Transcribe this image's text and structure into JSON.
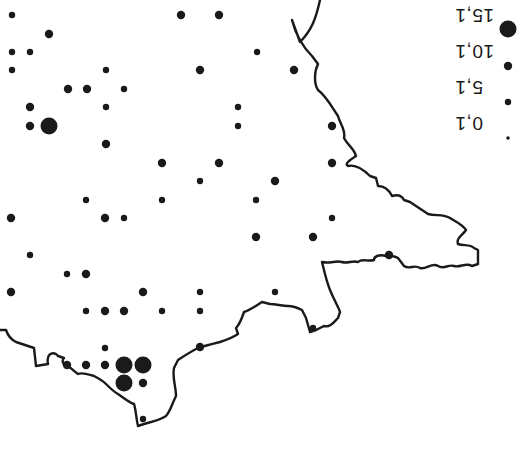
{
  "map": {
    "orientation": "rotated 180 degrees",
    "ink_color": "#1a1a1a",
    "background_color": "#ffffff",
    "coastline": "M320,0 C316,18 312,30 300,42 L292,20 C296,36 304,48 312,56 L318,64 C314,72 314,84 318,90 C326,96 330,104 338,116 C340,124 346,130 344,138 C348,146 354,148 356,156 C350,160 344,164 348,166 C356,164 364,170 370,176 L376,178 L378,186 C386,186 390,192 392,196 C398,194 402,196 404,200 L410,202 C416,206 422,210 428,214 C436,216 444,214 450,218 C456,222 462,224 466,230 C462,236 456,238 458,244 C464,246 470,244 474,248 L478,250 L478,264 L472,266 C466,262 460,268 454,266 C448,264 444,270 438,266 C432,262 426,270 420,268 C414,264 410,270 404,266 L398,258 C392,254 390,258 386,256 C380,254 374,256 374,260 C368,262 362,258 358,262 C352,260 348,264 342,262 C336,260 330,264 322,262 C324,270 326,280 330,290 C334,300 338,306 340,312 L338,318 C334,322 330,328 324,326 L316,330 L310,332 L306,318 L302,310 C298,308 294,306 288,306 C282,306 276,304 270,304 L262,302 C256,306 250,310 244,312 C242,318 240,324 236,328 L238,334 C232,338 226,340 220,342 C212,344 204,346 198,348 C190,352 184,356 178,360 L174,368 C172,378 176,386 176,396 C172,404 170,412 166,416 C160,420 152,422 144,424 L138,426 C136,418 136,410 134,404 C128,402 124,398 118,394 C114,392 110,388 106,384 C102,380 98,378 94,376 C88,374 82,372 78,374 C72,370 70,366 66,366 C62,364 62,360 64,358 L58,356 L56,354 C52,352 46,354 48,364 L36,366 L34,348 C28,346 22,344 16,342 C12,340 8,336 6,330 L0,330",
    "points": [
      {
        "x": 12,
        "y": 15,
        "value": 5.1
      },
      {
        "x": 49,
        "y": 34,
        "value": 10.1
      },
      {
        "x": 12,
        "y": 52,
        "value": 5.1
      },
      {
        "x": 30,
        "y": 52,
        "value": 5.1
      },
      {
        "x": 12,
        "y": 70,
        "value": 5.1
      },
      {
        "x": 106,
        "y": 70,
        "value": 5.1
      },
      {
        "x": 68,
        "y": 89,
        "value": 10.1
      },
      {
        "x": 87,
        "y": 89,
        "value": 10.1
      },
      {
        "x": 124,
        "y": 89,
        "value": 5.1
      },
      {
        "x": 30,
        "y": 107,
        "value": 10.1
      },
      {
        "x": 106,
        "y": 107,
        "value": 5.1
      },
      {
        "x": 30,
        "y": 126,
        "value": 10.1
      },
      {
        "x": 49,
        "y": 126,
        "value": 15.1
      },
      {
        "x": 106,
        "y": 144,
        "value": 10.1
      },
      {
        "x": 181,
        "y": 15,
        "value": 10.1
      },
      {
        "x": 219,
        "y": 15,
        "value": 10.1
      },
      {
        "x": 257,
        "y": 52,
        "value": 5.1
      },
      {
        "x": 200,
        "y": 70,
        "value": 10.1
      },
      {
        "x": 294,
        "y": 70,
        "value": 10.1
      },
      {
        "x": 238,
        "y": 107,
        "value": 5.1
      },
      {
        "x": 238,
        "y": 126,
        "value": 5.1
      },
      {
        "x": 332,
        "y": 126,
        "value": 10.1
      },
      {
        "x": 332,
        "y": 163,
        "value": 10.1
      },
      {
        "x": 332,
        "y": 218,
        "value": 5.1
      },
      {
        "x": 313,
        "y": 237,
        "value": 10.1
      },
      {
        "x": 389,
        "y": 255,
        "value": 10.1
      },
      {
        "x": 162,
        "y": 163,
        "value": 10.1
      },
      {
        "x": 219,
        "y": 163,
        "value": 10.1
      },
      {
        "x": 200,
        "y": 181,
        "value": 5.1
      },
      {
        "x": 275,
        "y": 181,
        "value": 10.1
      },
      {
        "x": 86,
        "y": 200,
        "value": 5.1
      },
      {
        "x": 162,
        "y": 200,
        "value": 5.1
      },
      {
        "x": 256,
        "y": 200,
        "value": 5.1
      },
      {
        "x": 11,
        "y": 218,
        "value": 10.1
      },
      {
        "x": 105,
        "y": 218,
        "value": 10.1
      },
      {
        "x": 124,
        "y": 218,
        "value": 5.1
      },
      {
        "x": 256,
        "y": 237,
        "value": 10.1
      },
      {
        "x": 30,
        "y": 255,
        "value": 5.1
      },
      {
        "x": 67,
        "y": 274,
        "value": 5.1
      },
      {
        "x": 86,
        "y": 274,
        "value": 10.1
      },
      {
        "x": 200,
        "y": 292,
        "value": 5.1
      },
      {
        "x": 275,
        "y": 292,
        "value": 5.1
      },
      {
        "x": 11,
        "y": 292,
        "value": 10.1
      },
      {
        "x": 143,
        "y": 292,
        "value": 10.1
      },
      {
        "x": 86,
        "y": 311,
        "value": 5.1
      },
      {
        "x": 105,
        "y": 311,
        "value": 10.1
      },
      {
        "x": 124,
        "y": 311,
        "value": 10.1
      },
      {
        "x": 162,
        "y": 311,
        "value": 5.1
      },
      {
        "x": 200,
        "y": 311,
        "value": 5.1
      },
      {
        "x": 105,
        "y": 348,
        "value": 5.1
      },
      {
        "x": 200,
        "y": 347,
        "value": 10.1
      },
      {
        "x": 67,
        "y": 365,
        "value": 10.1
      },
      {
        "x": 86,
        "y": 365,
        "value": 10.1
      },
      {
        "x": 105,
        "y": 365,
        "value": 10.1
      },
      {
        "x": 124,
        "y": 365,
        "value": 15.1
      },
      {
        "x": 143,
        "y": 365,
        "value": 15.1
      },
      {
        "x": 124,
        "y": 383,
        "value": 15.1
      },
      {
        "x": 143,
        "y": 383,
        "value": 10.1
      },
      {
        "x": 143,
        "y": 419,
        "value": 5.1
      },
      {
        "x": 313,
        "y": 328,
        "value": 5.1
      }
    ]
  },
  "legend": {
    "items": [
      {
        "label": "15,1",
        "value": 15.1,
        "dot_x": 508,
        "dot_y": 29,
        "label_x": 455,
        "label_y": 4
      },
      {
        "label": "10,1",
        "value": 10.1,
        "dot_x": 508,
        "dot_y": 66,
        "label_x": 455,
        "label_y": 40
      },
      {
        "label": "5,1",
        "value": 5.1,
        "dot_x": 508,
        "dot_y": 102,
        "label_x": 455,
        "label_y": 76
      },
      {
        "label": "0,1",
        "value": 0.1,
        "dot_x": 508,
        "dot_y": 138,
        "label_x": 455,
        "label_y": 112
      }
    ]
  },
  "size_scale": {
    "0.1": 1.8,
    "5.1": 3.2,
    "10.1": 4.2,
    "15.1": 8.5
  }
}
